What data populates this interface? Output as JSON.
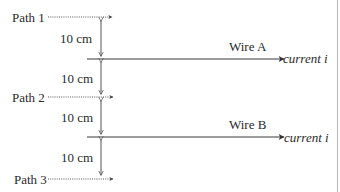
{
  "diagram": {
    "paths": [
      {
        "label": "Path 1"
      },
      {
        "label": "Path 2"
      },
      {
        "label": "Path 3"
      }
    ],
    "wires": [
      {
        "label": "Wire A",
        "current_label": "current i"
      },
      {
        "label": "Wire B",
        "current_label": "current i"
      }
    ],
    "distances": [
      {
        "label": "10 cm"
      },
      {
        "label": "10 cm"
      },
      {
        "label": "10 cm"
      },
      {
        "label": "10 cm"
      }
    ],
    "colors": {
      "line": "#3a3a3a",
      "text": "#2a2a2a",
      "border": "#b8b8b8"
    }
  }
}
